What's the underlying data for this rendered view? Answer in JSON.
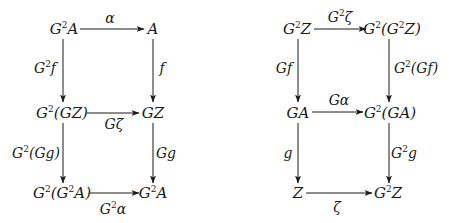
{
  "diagrams": [
    {
      "name": "left-commutative-diagram",
      "nodes": [
        {
          "id": "G2A_top",
          "base": "G",
          "sup": "2",
          "rest": "A",
          "x": 64,
          "y": 29
        },
        {
          "id": "A_top",
          "base": "A",
          "sup": "",
          "rest": "",
          "x": 153,
          "y": 29
        },
        {
          "id": "G2GZ",
          "base": "G",
          "sup": "2",
          "rest": "(GZ)",
          "x": 62,
          "y": 113
        },
        {
          "id": "GZ",
          "base": "GZ",
          "sup": "",
          "rest": "",
          "x": 153,
          "y": 113
        },
        {
          "id": "G2G2A",
          "base": "G",
          "sup": "2",
          "rest": "(G²A)",
          "x": 62,
          "y": 193
        },
        {
          "id": "G2A_bottom",
          "base": "G",
          "sup": "2",
          "rest": "A",
          "x": 153,
          "y": 193
        }
      ],
      "arrows": [
        {
          "from": "G2A_top",
          "to": "A_top",
          "label": "α",
          "label_sup": "",
          "label_base": "",
          "label_x": 110,
          "label_y": 18
        },
        {
          "from": "G2A_top",
          "to": "G2GZ",
          "label": "f",
          "label_base": "G",
          "label_sup": "2",
          "label_x": 46,
          "label_y": 68
        },
        {
          "from": "A_top",
          "to": "GZ",
          "label": "f",
          "label_base": "",
          "label_sup": "",
          "label_x": 162,
          "label_y": 68
        },
        {
          "from": "G2GZ",
          "to": "GZ",
          "label": "Gζ",
          "label_base": "",
          "label_sup": "",
          "label_x": 115,
          "label_y": 124
        },
        {
          "from": "G2GZ",
          "to": "G2G2A",
          "label": "(Gg)",
          "label_base": "G",
          "label_sup": "2",
          "label_x": 36,
          "label_y": 153
        },
        {
          "from": "GZ",
          "to": "G2A_bottom",
          "label": "Gg",
          "label_base": "",
          "label_sup": "",
          "label_x": 166,
          "label_y": 153
        },
        {
          "from": "G2G2A",
          "to": "G2A_bottom",
          "label": "α",
          "label_base": "G",
          "label_sup": "2",
          "label_x": 113,
          "label_y": 209
        }
      ]
    },
    {
      "name": "right-commutative-diagram",
      "nodes": [
        {
          "id": "G2Z_top",
          "base": "G",
          "sup": "2",
          "rest": "Z",
          "x": 297,
          "y": 29
        },
        {
          "id": "G2G2Z",
          "base": "G",
          "sup": "2",
          "rest": "(G²Z)",
          "x": 390,
          "y": 29
        },
        {
          "id": "GA",
          "base": "GA",
          "sup": "",
          "rest": "",
          "x": 298,
          "y": 113
        },
        {
          "id": "G2GA",
          "base": "G",
          "sup": "2",
          "rest": "(GA)",
          "x": 389,
          "y": 113
        },
        {
          "id": "Z",
          "base": "Z",
          "sup": "",
          "rest": "",
          "x": 298,
          "y": 193
        },
        {
          "id": "G2Z_bottom",
          "base": "G",
          "sup": "2",
          "rest": "Z",
          "x": 388,
          "y": 193
        }
      ],
      "arrows": [
        {
          "from": "G2Z_top",
          "to": "G2G2Z",
          "label": "ζ",
          "label_base": "G",
          "label_sup": "2",
          "label_x": 341,
          "label_y": 17
        },
        {
          "from": "G2Z_top",
          "to": "GA",
          "label": "Gf",
          "label_base": "",
          "label_sup": "",
          "label_x": 283,
          "label_y": 68
        },
        {
          "from": "G2G2Z",
          "to": "G2GA",
          "label": "(Gf)",
          "label_base": "G",
          "label_sup": "2",
          "label_x": 417,
          "label_y": 68
        },
        {
          "from": "GA",
          "to": "G2GA",
          "label": "Gα",
          "label_base": "",
          "label_sup": "",
          "label_x": 340,
          "label_y": 100
        },
        {
          "from": "GA",
          "to": "Z",
          "label": "g",
          "label_base": "",
          "label_sup": "",
          "label_x": 287,
          "label_y": 153
        },
        {
          "from": "G2GA",
          "to": "G2Z_bottom",
          "label": "g",
          "label_base": "G",
          "label_sup": "2",
          "label_x": 406,
          "label_y": 153
        },
        {
          "from": "Z",
          "to": "G2Z_bottom",
          "label": "ζ",
          "label_base": "",
          "label_sup": "",
          "label_x": 337,
          "label_y": 207
        }
      ]
    }
  ],
  "text": {
    "l_n1_b": "G",
    "l_n1_s": "2",
    "l_n1_r": "A",
    "l_n2": "A",
    "l_n3_b": "G",
    "l_n3_s": "2",
    "l_n3_r": "(GZ)",
    "l_n4": "GZ",
    "l_n5_b": "G",
    "l_n5_s": "2",
    "l_n5_r1": "(G",
    "l_n5_s2": "2",
    "l_n5_r2": "A)",
    "l_n6_b": "G",
    "l_n6_s": "2",
    "l_n6_r": "A",
    "l_a1": "α",
    "l_a2_b": "G",
    "l_a2_s": "2",
    "l_a2_r": "f",
    "l_a3": "f",
    "l_a4": "Gζ",
    "l_a5_b": "G",
    "l_a5_s": "2",
    "l_a5_r": "(Gg)",
    "l_a6": "Gg",
    "l_a7_b": "G",
    "l_a7_s": "2",
    "l_a7_r": "α",
    "r_n1_b": "G",
    "r_n1_s": "2",
    "r_n1_r": "Z",
    "r_n2_b": "G",
    "r_n2_s": "2",
    "r_n2_r1": "(G",
    "r_n2_s2": "2",
    "r_n2_r2": "Z)",
    "r_n3": "GA",
    "r_n4_b": "G",
    "r_n4_s": "2",
    "r_n4_r": "(GA)",
    "r_n5": "Z",
    "r_n6_b": "G",
    "r_n6_s": "2",
    "r_n6_r": "Z",
    "r_a1_b": "G",
    "r_a1_s": "2",
    "r_a1_r": "ζ",
    "r_a2": "Gf",
    "r_a3_b": "G",
    "r_a3_s": "2",
    "r_a3_r": "(Gf)",
    "r_a4": "Gα",
    "r_a5": "g",
    "r_a6_b": "G",
    "r_a6_s": "2",
    "r_a6_r": "g",
    "r_a7": "ζ"
  },
  "colors": {
    "ink": "#1a1a1a",
    "background": "#ffffff"
  }
}
